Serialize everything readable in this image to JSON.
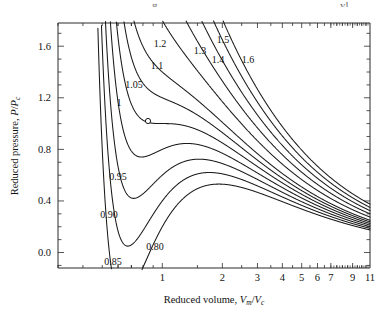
{
  "figure": {
    "top_fragment_left": "g",
    "top_fragment_right": "yl"
  },
  "axes": {
    "x_title_main": "Reduced volume, ",
    "x_title_sym1": "V",
    "x_title_sub1": "m",
    "x_title_slash": "/",
    "x_title_sym2": "V",
    "x_title_sub2": "c",
    "y_title_main": "Reduced pressure, ",
    "y_title_sym1": "P",
    "y_title_slash": "/",
    "y_title_sym2": "P",
    "y_title_sub2": "c",
    "x_tick_labels": [
      "1",
      "2",
      "3",
      "4",
      "5",
      "6",
      "7",
      "9",
      "11"
    ],
    "y_tick_labels": [
      "0.0",
      "0.4",
      "0.8",
      "1.2",
      "1.6"
    ]
  },
  "curve_labels": [
    {
      "text": "0.80",
      "x": 155,
      "y": 250
    },
    {
      "text": "0.85",
      "x": 113,
      "y": 265
    },
    {
      "text": "0.90",
      "x": 109,
      "y": 218
    },
    {
      "text": "0.95",
      "x": 118,
      "y": 180
    },
    {
      "text": "1",
      "x": 119,
      "y": 106
    },
    {
      "text": "1.05",
      "x": 134,
      "y": 88
    },
    {
      "text": "1.1",
      "x": 157,
      "y": 69
    },
    {
      "text": "1.2",
      "x": 160,
      "y": 47
    },
    {
      "text": "1.3",
      "x": 200,
      "y": 54
    },
    {
      "text": "1.4",
      "x": 218,
      "y": 63
    },
    {
      "text": "1.5",
      "x": 223,
      "y": 43
    },
    {
      "text": "1.6",
      "x": 248,
      "y": 63
    }
  ],
  "chart_data": {
    "type": "line",
    "title": "",
    "subtitle": "",
    "xlabel": "Reduced volume, Vm/Vc",
    "ylabel": "Reduced pressure, P/Pc",
    "xscale": "log",
    "yscale": "linear",
    "xlim": [
      0.3,
      11
    ],
    "ylim": [
      -0.12,
      1.78
    ],
    "grid": false,
    "legend": "inline-curve-labels",
    "annotations": [
      {
        "label": "critical point",
        "marker": "open-circle",
        "x": 1.0,
        "y": 1.0
      }
    ],
    "x_ticks_major": [
      1,
      2,
      3,
      4,
      5,
      6,
      7,
      9,
      11
    ],
    "y_ticks_major": [
      0.0,
      0.4,
      0.8,
      1.2,
      1.6
    ],
    "equation": "P/Pc = 8(T/Tc)/(3(Vm/Vc)-1) - 3/(Vm/Vc)^2",
    "series": [
      {
        "name": "0.80",
        "reduced_temperature": 0.8,
        "label_text": "0.80"
      },
      {
        "name": "0.85",
        "reduced_temperature": 0.85,
        "label_text": "0.85"
      },
      {
        "name": "0.90",
        "reduced_temperature": 0.9,
        "label_text": "0.90"
      },
      {
        "name": "0.95",
        "reduced_temperature": 0.95,
        "label_text": "0.95"
      },
      {
        "name": "1",
        "reduced_temperature": 1.0,
        "label_text": "1"
      },
      {
        "name": "1.05",
        "reduced_temperature": 1.05,
        "label_text": "1.05"
      },
      {
        "name": "1.1",
        "reduced_temperature": 1.1,
        "label_text": "1.1"
      },
      {
        "name": "1.2",
        "reduced_temperature": 1.2,
        "label_text": "1.2"
      },
      {
        "name": "1.3",
        "reduced_temperature": 1.3,
        "label_text": "1.3"
      },
      {
        "name": "1.4",
        "reduced_temperature": 1.4,
        "label_text": "1.4"
      },
      {
        "name": "1.5",
        "reduced_temperature": 1.5,
        "label_text": "1.5"
      },
      {
        "name": "1.6",
        "reduced_temperature": 1.6,
        "label_text": "1.6"
      }
    ]
  },
  "style": {
    "line_color": "#1a1a1a",
    "axis_color": "#2b2b2b",
    "background": "#ffffff"
  }
}
